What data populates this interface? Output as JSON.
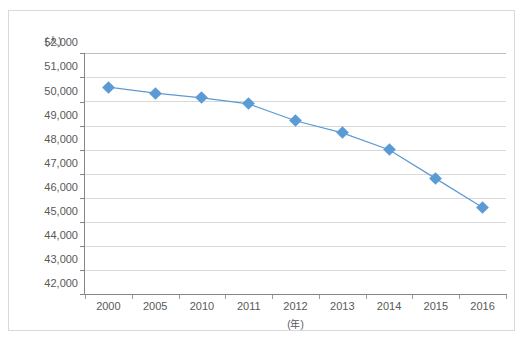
{
  "chart_data": {
    "type": "line",
    "title": "",
    "xlabel": "(年)",
    "ylabel": "(人)",
    "categories": [
      "2000",
      "2005",
      "2010",
      "2011",
      "2012",
      "2013",
      "2014",
      "2015",
      "2016"
    ],
    "values": [
      50600,
      50350,
      50150,
      49900,
      49200,
      48700,
      48000,
      46800,
      45600
    ],
    "series": [
      {
        "name": "人数",
        "values": [
          50600,
          50350,
          50150,
          49900,
          49200,
          48700,
          48000,
          46800,
          45600
        ]
      }
    ],
    "ylim": [
      42000,
      52000
    ],
    "ytick_step": 1000,
    "ytick_labels": [
      "52,000",
      "51,000",
      "50,000",
      "49,000",
      "48,000",
      "47,000",
      "46,000",
      "45,000",
      "44,000",
      "43,000",
      "42,000"
    ],
    "ytick_values": [
      52000,
      51000,
      50000,
      49000,
      48000,
      47000,
      46000,
      45000,
      44000,
      43000,
      42000
    ],
    "grid": true,
    "legend": "none",
    "marker": "diamond",
    "colors": {
      "series": "#5b9bd5",
      "grid": "#d9d9d9",
      "axis": "#868686",
      "text": "#595959",
      "border": "#d9d9d9"
    }
  }
}
